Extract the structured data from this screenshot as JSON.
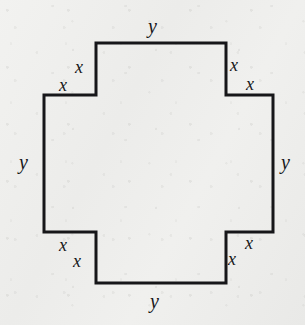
{
  "figure": {
    "shape_name": "cross-polygon",
    "background_color": "#efefed",
    "stroke_color": "#161619",
    "stroke_width": 3,
    "label_color": "#17171a"
  },
  "labels": {
    "y_top": "y",
    "y_bottom": "y",
    "y_left": "y",
    "y_right": "y",
    "x_top_left_vertical": "x",
    "x_top_left_horizontal": "x",
    "x_top_right_vertical": "x",
    "x_top_right_horizontal": "x",
    "x_bottom_left_vertical": "x",
    "x_bottom_left_horizontal": "x",
    "x_bottom_right_vertical": "x",
    "x_bottom_right_horizontal": "x"
  },
  "chart_data": {
    "type": "diagram",
    "shape": "cross",
    "vertex_count": 12,
    "vertices": [
      [
        96,
        43
      ],
      [
        226,
        43
      ],
      [
        226,
        95
      ],
      [
        273,
        95
      ],
      [
        273,
        232
      ],
      [
        226,
        232
      ],
      [
        226,
        283
      ],
      [
        96,
        283
      ],
      [
        96,
        232
      ],
      [
        44,
        232
      ],
      [
        44,
        95
      ],
      [
        96,
        95
      ]
    ],
    "edges": [
      {
        "from": [
          96,
          43
        ],
        "to": [
          226,
          43
        ],
        "label": "y",
        "orientation": "horizontal",
        "side": "top"
      },
      {
        "from": [
          226,
          43
        ],
        "to": [
          226,
          95
        ],
        "label": "x",
        "orientation": "vertical",
        "side": "top-right"
      },
      {
        "from": [
          226,
          95
        ],
        "to": [
          273,
          95
        ],
        "label": "x",
        "orientation": "horizontal",
        "side": "top-right"
      },
      {
        "from": [
          273,
          95
        ],
        "to": [
          273,
          232
        ],
        "label": "y",
        "orientation": "vertical",
        "side": "right"
      },
      {
        "from": [
          273,
          232
        ],
        "to": [
          226,
          232
        ],
        "label": "x",
        "orientation": "horizontal",
        "side": "bottom-right"
      },
      {
        "from": [
          226,
          232
        ],
        "to": [
          226,
          283
        ],
        "label": "x",
        "orientation": "vertical",
        "side": "bottom-right"
      },
      {
        "from": [
          226,
          283
        ],
        "to": [
          96,
          283
        ],
        "label": "y",
        "orientation": "horizontal",
        "side": "bottom"
      },
      {
        "from": [
          96,
          283
        ],
        "to": [
          96,
          232
        ],
        "label": "x",
        "orientation": "vertical",
        "side": "bottom-left"
      },
      {
        "from": [
          96,
          232
        ],
        "to": [
          44,
          232
        ],
        "label": "x",
        "orientation": "horizontal",
        "side": "bottom-left"
      },
      {
        "from": [
          44,
          232
        ],
        "to": [
          44,
          95
        ],
        "label": "y",
        "orientation": "vertical",
        "side": "left"
      },
      {
        "from": [
          44,
          95
        ],
        "to": [
          96,
          95
        ],
        "label": "x",
        "orientation": "horizontal",
        "side": "top-left"
      },
      {
        "from": [
          96,
          95
        ],
        "to": [
          96,
          43
        ],
        "label": "x",
        "orientation": "vertical",
        "side": "top-left"
      }
    ],
    "distinct_labels": [
      "x",
      "y"
    ],
    "label_counts": {
      "x": 8,
      "y": 4
    },
    "path_d": "M 96 43 L 226 43 L 226 95 L 273 95 L 273 232 L 226 232 L 226 283 L 96 283 L 96 232 L 44 232 L 44 95 L 96 95 Z",
    "xlim": [
      0,
      305
    ],
    "ylim": [
      0,
      325
    ],
    "grid": false,
    "legend": false
  }
}
